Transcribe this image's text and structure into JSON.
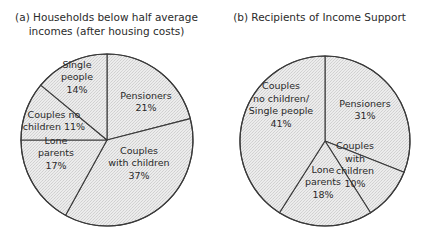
{
  "chart_data": [
    {
      "type": "pie",
      "title": "(a) Households below half average incomes (after housing costs)",
      "title_lines": [
        "(a) Households below half average",
        "incomes (after housing costs)"
      ],
      "start_angle": "12 o'clock",
      "direction": "clockwise",
      "center": [
        107,
        140
      ],
      "radius": 86,
      "slices": [
        {
          "label": "Pensioners",
          "label_lines": [
            "Pensioners",
            "21%"
          ],
          "value": 21,
          "label_pos": [
            146,
            102
          ]
        },
        {
          "label": "Couples with children",
          "label_lines": [
            "Couples",
            "with children",
            "37%"
          ],
          "value": 37,
          "label_pos": [
            139,
            163
          ]
        },
        {
          "label": "Lone parents",
          "label_lines": [
            "Lone",
            "parents",
            "17%"
          ],
          "value": 17,
          "label_pos": [
            56,
            153
          ]
        },
        {
          "label": "Couples no children",
          "label_lines": [
            "Couples no",
            "children 11%"
          ],
          "value": 11,
          "label_pos": [
            54,
            121
          ]
        },
        {
          "label": "Single people",
          "label_lines": [
            "Single",
            "people",
            "14%"
          ],
          "value": 14,
          "label_pos": [
            77,
            77
          ]
        }
      ]
    },
    {
      "type": "pie",
      "title": "(b) Recipients of Income Support",
      "title_lines": [
        "(b) Recipients of Income Support"
      ],
      "start_angle": "12 o'clock",
      "direction": "clockwise",
      "center": [
        325,
        141
      ],
      "radius": 85,
      "slices": [
        {
          "label": "Pensioners",
          "label_lines": [
            "Pensioners",
            "31%"
          ],
          "value": 31,
          "label_pos": [
            365,
            110
          ]
        },
        {
          "label": "Couples with children",
          "label_lines": [
            "Couples",
            "with",
            "children",
            "10%"
          ],
          "value": 10,
          "label_pos": [
            355,
            165
          ]
        },
        {
          "label": "Lone parents",
          "label_lines": [
            "Lone",
            "parents",
            "18%"
          ],
          "value": 18,
          "label_pos": [
            323,
            182
          ]
        },
        {
          "label": "Couples no children/Single people",
          "label_lines": [
            "Couples",
            "no children/",
            "Single people",
            "41%"
          ],
          "value": 41,
          "label_pos": [
            281,
            105
          ]
        }
      ]
    }
  ],
  "style": {
    "fill": "#e4e4e4",
    "stroke": "#3a3a3a",
    "text": "#2a2a2a"
  }
}
